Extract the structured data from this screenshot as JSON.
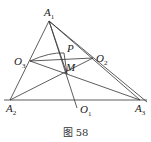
{
  "caption": "图 58",
  "points": {
    "A1": {
      "name": "A",
      "sub": "1",
      "x": 49,
      "y": 21
    },
    "A2": {
      "name": "A",
      "sub": "2",
      "x": 10,
      "y": 100
    },
    "A3": {
      "name": "A",
      "sub": "3",
      "x": 140,
      "y": 100
    },
    "O1": {
      "name": "O",
      "sub": "1",
      "x": 77,
      "y": 108
    },
    "O2": {
      "name": "O",
      "sub": "2",
      "x": 93,
      "y": 58
    },
    "O3": {
      "name": "O",
      "sub": "3",
      "x": 30,
      "y": 61
    },
    "M": {
      "name": "M",
      "sub": "",
      "x": 67,
      "y": 74
    },
    "P": {
      "name": "P",
      "sub": "",
      "x": 64,
      "y": 53
    }
  },
  "colors": {
    "stroke": "#333333",
    "text": "#222222"
  }
}
